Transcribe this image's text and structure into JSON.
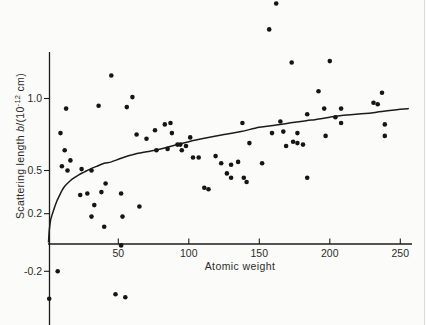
{
  "figure": {
    "background": "#fbfbf9",
    "ink": "#1c1c1c",
    "text_color": "#2b2b2b"
  },
  "chart_data": {
    "type": "scatter",
    "title": "",
    "xlabel": "Atomic weight",
    "ylabel_text": "Scattering length b/(10^-12 cm)",
    "ylabel_parts": {
      "prefix": "Scattering length ",
      "symbol": "b",
      "unit_open": "/(10",
      "unit_exp": "-12",
      "unit_close": " cm)"
    },
    "xlim": [
      0,
      258
    ],
    "ylim": [
      -0.55,
      1.68
    ],
    "grid": false,
    "legend": null,
    "x_ticks": [
      50,
      100,
      150,
      200,
      250
    ],
    "x_tick_labels": [
      "50",
      "100",
      "150",
      "200",
      "250"
    ],
    "y_ticks": [
      1.0,
      0.5,
      0.2,
      -0.2
    ],
    "y_tick_labels": [
      "1.0",
      "0.5",
      "0.2",
      "-0.2"
    ],
    "points": [
      [
        45,
        1.16
      ],
      [
        13,
        0.93
      ],
      [
        36,
        0.95
      ],
      [
        56,
        0.94
      ],
      [
        60,
        1.01
      ],
      [
        162,
        1.66
      ],
      [
        157,
        1.48
      ],
      [
        173,
        1.25
      ],
      [
        200,
        1.26
      ],
      [
        192,
        1.05
      ],
      [
        237,
        1.04
      ],
      [
        231,
        0.97
      ],
      [
        234,
        0.96
      ],
      [
        196,
        0.93
      ],
      [
        208,
        0.93
      ],
      [
        204,
        0.87
      ],
      [
        184,
        0.89
      ],
      [
        9,
        0.76
      ],
      [
        12,
        0.64
      ],
      [
        16,
        0.57
      ],
      [
        10,
        0.53
      ],
      [
        14,
        0.5
      ],
      [
        24,
        0.51
      ],
      [
        31,
        0.5
      ],
      [
        28,
        0.34
      ],
      [
        23,
        0.33
      ],
      [
        33,
        0.26
      ],
      [
        31,
        0.18
      ],
      [
        41,
        0.41
      ],
      [
        38,
        0.35
      ],
      [
        52,
        0.34
      ],
      [
        53,
        0.18
      ],
      [
        40,
        0.11
      ],
      [
        65,
        0.25
      ],
      [
        63,
        0.75
      ],
      [
        70,
        0.72
      ],
      [
        76,
        0.78
      ],
      [
        83,
        0.82
      ],
      [
        77,
        0.64
      ],
      [
        87,
        0.83
      ],
      [
        88,
        0.76
      ],
      [
        101,
        0.73
      ],
      [
        85,
        0.65
      ],
      [
        92,
        0.68
      ],
      [
        94,
        0.68
      ],
      [
        98,
        0.67
      ],
      [
        95,
        0.64
      ],
      [
        103,
        0.59
      ],
      [
        107,
        0.59
      ],
      [
        119,
        0.6
      ],
      [
        123,
        0.55
      ],
      [
        130,
        0.54
      ],
      [
        135,
        0.56
      ],
      [
        127,
        0.48
      ],
      [
        130,
        0.45
      ],
      [
        139,
        0.45
      ],
      [
        141,
        0.42
      ],
      [
        111,
        0.38
      ],
      [
        114,
        0.37
      ],
      [
        138,
        0.83
      ],
      [
        143,
        0.69
      ],
      [
        159,
        0.76
      ],
      [
        167,
        0.77
      ],
      [
        165,
        0.84
      ],
      [
        169,
        0.67
      ],
      [
        152,
        0.55
      ],
      [
        208,
        0.83
      ],
      [
        177,
        0.76
      ],
      [
        174,
        0.7
      ],
      [
        177,
        0.69
      ],
      [
        181,
        0.68
      ],
      [
        197,
        0.74
      ],
      [
        239,
        0.82
      ],
      [
        239,
        0.74
      ],
      [
        184,
        0.45
      ],
      [
        52,
        -0.02
      ],
      [
        7,
        -0.2
      ],
      [
        1,
        -0.39
      ],
      [
        48,
        -0.36
      ],
      [
        55,
        -0.38
      ]
    ],
    "curve": {
      "name": "potential-scattering-curve",
      "samples": [
        [
          0.5,
          0.0
        ],
        [
          0.8,
          0.05
        ],
        [
          1.2,
          0.1
        ],
        [
          2,
          0.155
        ],
        [
          3,
          0.19
        ],
        [
          4,
          0.22
        ],
        [
          5,
          0.25
        ],
        [
          6.5,
          0.29
        ],
        [
          8,
          0.32
        ],
        [
          10,
          0.36
        ],
        [
          12,
          0.39
        ],
        [
          15,
          0.42
        ],
        [
          18,
          0.445
        ],
        [
          22,
          0.47
        ],
        [
          26,
          0.49
        ],
        [
          30,
          0.51
        ],
        [
          35,
          0.53
        ],
        [
          40,
          0.55
        ],
        [
          45,
          0.56
        ],
        [
          52,
          0.585
        ],
        [
          60,
          0.61
        ],
        [
          70,
          0.63
        ],
        [
          80,
          0.65
        ],
        [
          90,
          0.675
        ],
        [
          100,
          0.7
        ],
        [
          112,
          0.725
        ],
        [
          125,
          0.75
        ],
        [
          137,
          0.77
        ],
        [
          150,
          0.8
        ],
        [
          162,
          0.815
        ],
        [
          175,
          0.835
        ],
        [
          187,
          0.85
        ],
        [
          200,
          0.87
        ],
        [
          212,
          0.885
        ],
        [
          225,
          0.895
        ],
        [
          237,
          0.91
        ],
        [
          250,
          0.925
        ],
        [
          256,
          0.93
        ]
      ]
    }
  }
}
